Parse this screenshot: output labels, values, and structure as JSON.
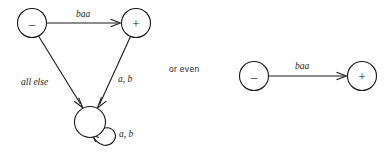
{
  "figure": {
    "background_color": "#ffffff",
    "ink_color": "#1a1a1a",
    "connector_text": "or even"
  },
  "left_automaton": {
    "name": "three-state-automaton",
    "nodes": [
      {
        "id": "minus",
        "label": "–",
        "cx": 32,
        "cy": 23,
        "r": 14.5
      },
      {
        "id": "plus",
        "label": "+",
        "cx": 136,
        "cy": 23,
        "r": 14.5
      },
      {
        "id": "sink",
        "label": "",
        "cx": 90,
        "cy": 122,
        "r": 15.5
      }
    ],
    "edges": [
      {
        "id": "minus-to-plus",
        "label": "baa",
        "from": "minus",
        "to": "plus",
        "label_x": 83,
        "label_y": 14
      },
      {
        "id": "minus-to-sink",
        "label": "all else",
        "from": "minus",
        "to": "sink",
        "label_x": 21,
        "label_y": 82
      },
      {
        "id": "plus-to-sink",
        "label": "a, b",
        "from": "plus",
        "to": "sink",
        "label_x": 122,
        "label_y": 79
      },
      {
        "id": "sink-self-loop",
        "label": "a, b",
        "from": "sink",
        "to": "sink",
        "label_x": 123,
        "label_y": 134
      }
    ]
  },
  "right_automaton": {
    "name": "two-state-automaton",
    "nodes": [
      {
        "id": "minus",
        "label": "–",
        "cx": 254,
        "cy": 76,
        "r": 14.5
      },
      {
        "id": "plus",
        "label": "+",
        "cx": 362,
        "cy": 76,
        "r": 14.5
      }
    ],
    "edges": [
      {
        "id": "minus-to-plus",
        "label": "baa",
        "from": "minus",
        "to": "plus",
        "label_x": 302,
        "label_y": 66
      }
    ]
  }
}
